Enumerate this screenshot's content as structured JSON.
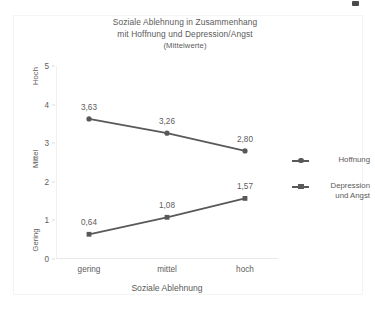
{
  "chart_data": {
    "type": "line",
    "title": "Soziale Ablehnung in Zusammenhang mit Hoffnung und Depression/Angst (Mittelwerte)",
    "title_lines": [
      "Soziale Ablehnung in Zusammenhang",
      "mit Hoffnung und Depression/Angst"
    ],
    "subtitle": "(Mittelwerte)",
    "categories": [
      "gering",
      "mittel",
      "hoch"
    ],
    "xlabel": "Soziale Ablehnung",
    "ylabel": "",
    "ylim": [
      0,
      5
    ],
    "yticks": [
      "0",
      "1",
      "2",
      "3",
      "4",
      "5"
    ],
    "ytick_values": [
      0,
      1,
      2,
      3,
      4,
      5
    ],
    "band_labels": [
      {
        "label": "Gering",
        "value": 0.5
      },
      {
        "label": "Mittel",
        "value": 2.6
      },
      {
        "label": "Hoch",
        "value": 4.75
      }
    ],
    "grid": false,
    "legend_position": "right",
    "series": [
      {
        "name": "Hoffnung",
        "marker": "circle",
        "color": "#595959",
        "values": [
          3.63,
          3.26,
          2.8
        ],
        "labels": [
          "3,63",
          "3,26",
          "2,80"
        ]
      },
      {
        "name": "Depression und Angst",
        "name_lines": [
          "Depression",
          "und Angst"
        ],
        "marker": "square",
        "color": "#595959",
        "values": [
          0.64,
          1.08,
          1.57
        ],
        "labels": [
          "0,64",
          "1,08",
          "1,57"
        ]
      }
    ]
  },
  "colors": {
    "series": "#595959",
    "text": "#5a5a5a",
    "axis": "#e8e8e8",
    "frame": "#f4f4f4",
    "background": "#ffffff"
  }
}
